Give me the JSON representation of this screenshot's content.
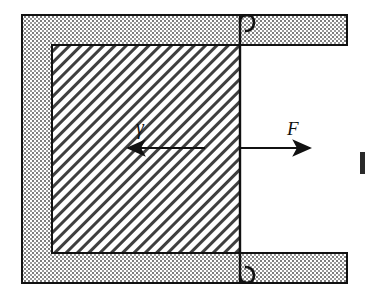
{
  "figure": {
    "name": "shear-deformation-diagram",
    "width": 369,
    "height": 298,
    "background_color": "#ffffff",
    "line_color": "#111111",
    "fill_stipple_color": "#8a8a8a",
    "hatch_color": "#4a4a4a"
  },
  "labels": {
    "force": "F",
    "shear_strain": "γ"
  },
  "arrows": {
    "force_arrow": {
      "name": "force-arrow-right",
      "direction": "right",
      "x_start": 240,
      "x_end": 316,
      "y": 148
    },
    "shear_arrow": {
      "name": "shear-strain-arrow-left",
      "direction": "left",
      "x_start": 205,
      "x_end": 122,
      "y": 148
    }
  },
  "frame": {
    "name": "fixed-support-bracket",
    "outer_left": 22,
    "outer_top": 15,
    "outer_bottom": 283,
    "top_bar_right": 347,
    "bottom_bar_right": 347,
    "bar_thickness": 30,
    "left_column_width": 30,
    "opening_side": "right"
  },
  "specimen": {
    "name": "hatched-specimen-block",
    "left": 52,
    "top": 45,
    "right": 240,
    "bottom": 253,
    "hatch_angle_deg": 45,
    "hatch_spacing": 8
  },
  "hooks": {
    "top_hook": {
      "name": "top-attachment-hook",
      "x": 240,
      "y": 15
    },
    "bottom_hook": {
      "name": "bottom-attachment-hook",
      "x": 240,
      "y": 283
    }
  },
  "edge_mark": {
    "name": "cropped-edge-bar",
    "x": 360,
    "y": 152,
    "width": 5,
    "height": 22
  }
}
